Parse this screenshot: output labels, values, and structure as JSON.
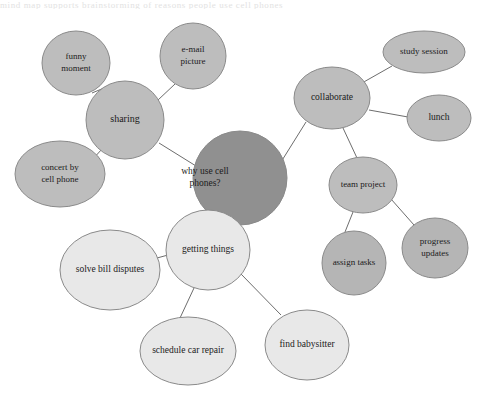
{
  "page": {
    "background_color": "#ffffff",
    "width": 479,
    "height": 401,
    "top_text_remnant": "mind map supports brainstorming of reasons people use cell phones"
  },
  "diagram": {
    "type": "mind-map",
    "colors": {
      "center_fill": "#909090",
      "branch_fill": "#bdbdbd",
      "sub_fill": "#b5b5b5",
      "light_fill": "#e8e8e8",
      "stroke": "#8a8a8a",
      "edge": "#6d6d6d",
      "text": "#1b1b1b"
    },
    "nodes": [
      {
        "id": "center",
        "label": "why use cell phones?",
        "lines": [
          "why use cell",
          "phones?"
        ],
        "shape": "circle",
        "cx": 240,
        "cy": 178,
        "rx": 47,
        "ry": 47,
        "fill": "#909090",
        "font_size": 9.5,
        "text_anchor": "start",
        "text_x": 205
      },
      {
        "id": "sharing",
        "label": "sharing",
        "lines": [
          "sharing"
        ],
        "shape": "circle",
        "cx": 125,
        "cy": 120,
        "rx": 39,
        "ry": 39,
        "fill": "#bdbdbd",
        "font_size": 10,
        "text_anchor": "middle",
        "text_x": 125
      },
      {
        "id": "funny-moment",
        "label": "funny moment",
        "lines": [
          "funny",
          "moment"
        ],
        "shape": "circle",
        "cx": 76,
        "cy": 63,
        "rx": 34,
        "ry": 32,
        "fill": "#bdbdbd",
        "font_size": 9,
        "text_anchor": "middle",
        "text_x": 76
      },
      {
        "id": "email-picture",
        "label": "e-mail picture",
        "lines": [
          "e-mail",
          "picture"
        ],
        "shape": "circle",
        "cx": 193,
        "cy": 56,
        "rx": 33,
        "ry": 33,
        "fill": "#bdbdbd",
        "font_size": 9,
        "text_anchor": "middle",
        "text_x": 193
      },
      {
        "id": "concert-by-cell-phone",
        "label": "concert by cell phone",
        "lines": [
          "concert by",
          "cell phone"
        ],
        "shape": "circle",
        "cx": 60,
        "cy": 174,
        "rx": 45,
        "ry": 33,
        "fill": "#bdbdbd",
        "font_size": 9,
        "text_anchor": "middle",
        "text_x": 60
      },
      {
        "id": "collaborate",
        "label": "collaborate",
        "lines": [
          "collaborate"
        ],
        "shape": "ellipse",
        "cx": 332,
        "cy": 98,
        "rx": 38,
        "ry": 31,
        "fill": "#bdbdbd",
        "font_size": 9.5,
        "text_anchor": "middle",
        "text_x": 332
      },
      {
        "id": "study-session",
        "label": "study session",
        "lines": [
          "study session"
        ],
        "shape": "ellipse",
        "cx": 424,
        "cy": 52,
        "rx": 41,
        "ry": 21,
        "fill": "#bdbdbd",
        "font_size": 9,
        "text_anchor": "middle",
        "text_x": 424
      },
      {
        "id": "lunch",
        "label": "lunch",
        "lines": [
          "lunch"
        ],
        "shape": "ellipse",
        "cx": 439,
        "cy": 118,
        "rx": 32,
        "ry": 23,
        "fill": "#bdbdbd",
        "font_size": 9.5,
        "text_anchor": "middle",
        "text_x": 439
      },
      {
        "id": "team-project",
        "label": "team project",
        "lines": [
          "team project"
        ],
        "shape": "ellipse",
        "cx": 363,
        "cy": 185,
        "rx": 34,
        "ry": 28,
        "fill": "#bdbdbd",
        "font_size": 9,
        "text_anchor": "middle",
        "text_x": 363
      },
      {
        "id": "assign-tasks",
        "label": "assign tasks",
        "lines": [
          "assign tasks"
        ],
        "shape": "circle",
        "cx": 354,
        "cy": 263,
        "rx": 32,
        "ry": 32,
        "fill": "#b5b5b5",
        "font_size": 9,
        "text_anchor": "middle",
        "text_x": 354
      },
      {
        "id": "progress-updates",
        "label": "progress updates",
        "lines": [
          "progress",
          "updates"
        ],
        "shape": "ellipse",
        "cx": 435,
        "cy": 248,
        "rx": 33,
        "ry": 30,
        "fill": "#b5b5b5",
        "font_size": 9,
        "text_anchor": "middle",
        "text_x": 435
      },
      {
        "id": "getting-things",
        "label": "getting things",
        "lines": [
          "getting things"
        ],
        "shape": "circle",
        "cx": 208,
        "cy": 250,
        "rx": 42,
        "ry": 40,
        "fill": "#e8e8e8",
        "font_size": 9.5,
        "text_anchor": "middle",
        "text_x": 208
      },
      {
        "id": "solve-bill-disputes",
        "label": "solve bill disputes",
        "lines": [
          "solve bill disputes"
        ],
        "shape": "circle",
        "cx": 110,
        "cy": 270,
        "rx": 50,
        "ry": 40,
        "fill": "#e8e8e8",
        "font_size": 9.5,
        "text_anchor": "middle",
        "text_x": 110
      },
      {
        "id": "schedule-car-repair",
        "label": "schedule car repair",
        "lines": [
          "schedule car repair"
        ],
        "shape": "ellipse",
        "cx": 188,
        "cy": 351,
        "rx": 48,
        "ry": 34,
        "fill": "#e8e8e8",
        "font_size": 9.5,
        "text_anchor": "middle",
        "text_x": 188
      },
      {
        "id": "find-babysitter",
        "label": "find babysitter",
        "lines": [
          "find babysitter"
        ],
        "shape": "ellipse",
        "cx": 307,
        "cy": 345,
        "rx": 42,
        "ry": 35,
        "fill": "#e8e8e8",
        "font_size": 9.5,
        "text_anchor": "middle",
        "text_x": 307
      }
    ],
    "edges": [
      {
        "id": "edge-center-sharing",
        "from": "center",
        "to": "sharing",
        "x1": 196,
        "y1": 166,
        "x2": 159,
        "y2": 143
      },
      {
        "id": "edge-center-collaborate",
        "from": "center",
        "to": "collaborate",
        "x1": 281,
        "y1": 162,
        "x2": 306,
        "y2": 122
      },
      {
        "id": "edge-center-getting-things",
        "from": "center",
        "to": "getting-things",
        "x1": 227,
        "y1": 223,
        "x2": 215,
        "y2": 211
      },
      {
        "id": "edge-sharing-funny",
        "from": "sharing",
        "to": "funny-moment",
        "x1": 104,
        "y1": 88,
        "x2": 92,
        "y2": 93
      },
      {
        "id": "edge-sharing-email",
        "from": "sharing",
        "to": "email-picture",
        "x1": 158,
        "y1": 100,
        "x2": 175,
        "y2": 84
      },
      {
        "id": "edge-sharing-concert",
        "from": "sharing",
        "to": "concert-by-cell-phone",
        "x1": 102,
        "y1": 149,
        "x2": 92,
        "y2": 160
      },
      {
        "id": "edge-collaborate-study",
        "from": "collaborate",
        "to": "study-session",
        "x1": 362,
        "y1": 83,
        "x2": 392,
        "y2": 66
      },
      {
        "id": "edge-collaborate-lunch",
        "from": "collaborate",
        "to": "lunch",
        "x1": 369,
        "y1": 110,
        "x2": 408,
        "y2": 117
      },
      {
        "id": "edge-collaborate-team",
        "from": "collaborate",
        "to": "team-project",
        "x1": 343,
        "y1": 128,
        "x2": 357,
        "y2": 158
      },
      {
        "id": "edge-team-assign",
        "from": "team-project",
        "to": "assign-tasks",
        "x1": 353,
        "y1": 212,
        "x2": 345,
        "y2": 232
      },
      {
        "id": "edge-team-progress",
        "from": "team-project",
        "to": "progress-updates",
        "x1": 391,
        "y1": 199,
        "x2": 414,
        "y2": 225
      },
      {
        "id": "edge-getting-solve",
        "from": "getting-things",
        "to": "solve-bill-disputes",
        "x1": 168,
        "y1": 255,
        "x2": 157,
        "y2": 258
      },
      {
        "id": "edge-getting-schedule",
        "from": "getting-things",
        "to": "schedule-car-repair",
        "x1": 194,
        "y1": 288,
        "x2": 180,
        "y2": 318
      },
      {
        "id": "edge-getting-find",
        "from": "getting-things",
        "to": "find-babysitter",
        "x1": 241,
        "y1": 274,
        "x2": 281,
        "y2": 315
      }
    ]
  }
}
